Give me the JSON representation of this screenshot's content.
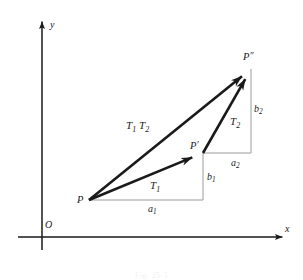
{
  "figure": {
    "background_color": "#ffffff",
    "ink_color": "#1a1a1a",
    "construction_color": "#9a9a9a",
    "width": 303,
    "height": 280,
    "caption": "Fig. 25-3"
  },
  "axes": {
    "x_label": "x",
    "y_label": "y",
    "origin_label": "O",
    "x_axis": {
      "x1": 18,
      "y1": 237,
      "x2": 290,
      "y2": 237
    },
    "y_axis": {
      "x1": 42,
      "y1": 250,
      "x2": 42,
      "y2": 14
    }
  },
  "points": {
    "p": {
      "label": "P",
      "prime": "",
      "x": 89,
      "y": 200,
      "label_x": 77,
      "label_y": 194
    },
    "pprime": {
      "label": "P",
      "prime": "′",
      "x": 203,
      "y": 153,
      "label_x": 190,
      "label_y": 140
    },
    "pdprime": {
      "label": "P",
      "prime": "″",
      "x": 251,
      "y": 69,
      "label_x": 243,
      "label_y": 51
    }
  },
  "vectors": [
    {
      "name": "T1",
      "base": "T",
      "sub": "1",
      "from": "p",
      "to": "pprime",
      "label_x": 150,
      "label_y": 180,
      "x1": 89,
      "y1": 200,
      "x2": 203,
      "y2": 153
    },
    {
      "name": "T2",
      "base": "T",
      "sub": "2",
      "from": "pprime",
      "to": "pdprime",
      "label_x": 230,
      "label_y": 116,
      "x1": 203,
      "y1": 153,
      "x2": 251,
      "y2": 69
    },
    {
      "name": "T1T2",
      "base": "T",
      "sub": "1",
      "base2": "T",
      "sub2": "2",
      "from": "p",
      "to": "pdprime",
      "label_x": 126,
      "label_y": 120,
      "x1": 89,
      "y1": 200,
      "x2": 251,
      "y2": 69
    }
  ],
  "components": [
    {
      "name": "a1",
      "base": "a",
      "sub": "1",
      "label_x": 148,
      "label_y": 204,
      "orientation": "horizontal",
      "x1": 89,
      "y1": 200,
      "x2": 203,
      "y2": 200
    },
    {
      "name": "b1",
      "base": "b",
      "sub": "1",
      "label_x": 207,
      "label_y": 172,
      "orientation": "vertical",
      "x1": 203,
      "y1": 153,
      "x2": 203,
      "y2": 200
    },
    {
      "name": "a2",
      "base": "a",
      "sub": "2",
      "label_x": 231,
      "label_y": 158,
      "orientation": "horizontal",
      "x1": 203,
      "y1": 153,
      "x2": 251,
      "y2": 153
    },
    {
      "name": "b2",
      "base": "b",
      "sub": "2",
      "label_x": 254,
      "label_y": 104,
      "orientation": "vertical",
      "x1": 251,
      "y1": 69,
      "x2": 251,
      "y2": 153
    }
  ]
}
